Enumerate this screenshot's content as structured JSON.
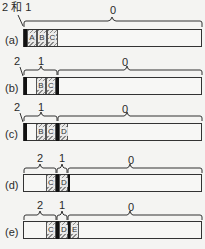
{
  "diagram": {
    "rows": [
      {
        "id": "a",
        "label": "(a)",
        "pointer_labels": [
          {
            "text": "2 和 1"
          }
        ],
        "brace_labels": [
          {
            "text": "0"
          }
        ],
        "cells": [
          {
            "text": "A",
            "type": "hatched"
          },
          {
            "text": "B",
            "type": "hatched"
          },
          {
            "text": "C",
            "type": "hatched"
          }
        ]
      },
      {
        "id": "b",
        "label": "(b)",
        "pointer_labels": [
          {
            "text": "2"
          }
        ],
        "brace_labels": [
          {
            "text": "1"
          },
          {
            "text": "0"
          }
        ],
        "cells": [
          {
            "text": "",
            "type": "empty"
          },
          {
            "text": "B",
            "type": "hatched"
          },
          {
            "text": "C",
            "type": "hatched"
          }
        ]
      },
      {
        "id": "c",
        "label": "(c)",
        "pointer_labels": [
          {
            "text": "2"
          }
        ],
        "brace_labels": [
          {
            "text": "1"
          },
          {
            "text": "0"
          }
        ],
        "cells": [
          {
            "text": "",
            "type": "empty"
          },
          {
            "text": "B",
            "type": "hatched"
          },
          {
            "text": "C",
            "type": "hatched"
          },
          {
            "text": "D",
            "type": "hatched"
          }
        ]
      },
      {
        "id": "d",
        "label": "(d)",
        "brace_labels": [
          {
            "text": "2"
          },
          {
            "text": "1"
          },
          {
            "text": "0"
          }
        ],
        "cells": [
          {
            "text": "C",
            "type": "hatched"
          },
          {
            "text": "D",
            "type": "hatched"
          }
        ]
      },
      {
        "id": "e",
        "label": "(e)",
        "brace_labels": [
          {
            "text": "2"
          },
          {
            "text": "1"
          },
          {
            "text": "0"
          }
        ],
        "cells": [
          {
            "text": "C",
            "type": "hatched"
          },
          {
            "text": "D",
            "type": "hatched"
          },
          {
            "text": "E",
            "type": "hatched"
          }
        ]
      }
    ]
  }
}
